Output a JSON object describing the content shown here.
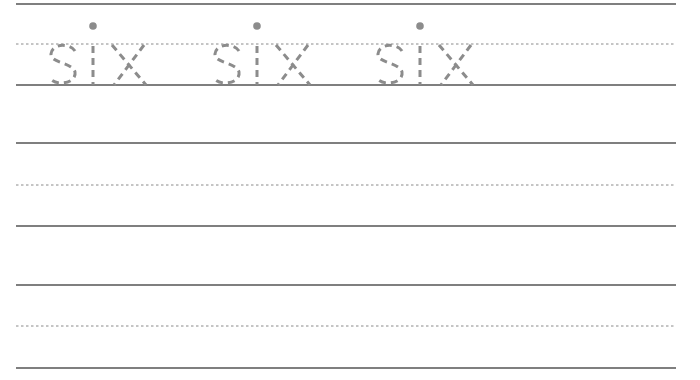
{
  "worksheet": {
    "word": "six",
    "trace_count": 3,
    "trace_positions_x": [
      48,
      212,
      375
    ],
    "line_color": "#555555",
    "midline_color": "#8a8a8a",
    "trace_color": "#8c8c8c",
    "rows": [
      {
        "top": 4,
        "mid": 44,
        "base": 85
      },
      {
        "top": 143,
        "mid": 185,
        "base": 226
      },
      {
        "top": 285,
        "mid": 326,
        "base": 368
      }
    ],
    "line_start_x": 16,
    "line_end_x": 676
  }
}
